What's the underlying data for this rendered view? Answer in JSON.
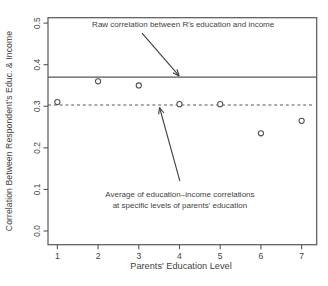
{
  "chart_data": {
    "type": "scatter",
    "title": "",
    "xlabel": "Parents' Education Level",
    "ylabel": "Correlation Between Respondent's Educ. & Income",
    "x": [
      1,
      2,
      3,
      4,
      5,
      6,
      7
    ],
    "values": [
      0.31,
      0.36,
      0.35,
      0.305,
      0.305,
      0.235,
      0.265
    ],
    "marker": "open-circle",
    "grid": false,
    "xlim": [
      0.77,
      7.37
    ],
    "ylim": [
      -0.033,
      0.513
    ],
    "xticks": [
      "1",
      "2",
      "3",
      "4",
      "5",
      "6",
      "7"
    ],
    "xtick_values": [
      1,
      2,
      3,
      4,
      5,
      6,
      7
    ],
    "yticks": [
      "0.0",
      "0.1",
      "0.2",
      "0.3",
      "0.4",
      "0.5"
    ],
    "ytick_values": [
      0.0,
      0.1,
      0.2,
      0.3,
      0.4,
      0.5
    ],
    "reference_lines": [
      {
        "name": "raw-correlation-line",
        "style": "solid",
        "value": 0.37
      },
      {
        "name": "average-correlation-line",
        "style": "dashed",
        "value": 0.303
      }
    ],
    "annotations": [
      {
        "name": "raw-correlation-label",
        "lines": [
          "Raw correlation between R's education and income"
        ],
        "x": 4.09,
        "y": 0.495,
        "arrow": {
          "from": {
            "x": 3.08,
            "y": 0.476
          },
          "to": {
            "x": 3.99,
            "y": 0.373
          }
        }
      },
      {
        "name": "average-correlation-label",
        "lines": [
          "Average of education–income correlations",
          "at specific levels of parents' education"
        ],
        "x": 4.01,
        "y": 0.071,
        "arrow": {
          "from": {
            "x": 4.01,
            "y": 0.12
          },
          "to": {
            "x": 3.51,
            "y": 0.297
          }
        }
      }
    ],
    "colors": {
      "ink": "#3f3f3f",
      "frame": "#565656",
      "point_stroke": "#4f4f4f",
      "point_fill": "#ffffff",
      "background": "#ffffff"
    }
  }
}
